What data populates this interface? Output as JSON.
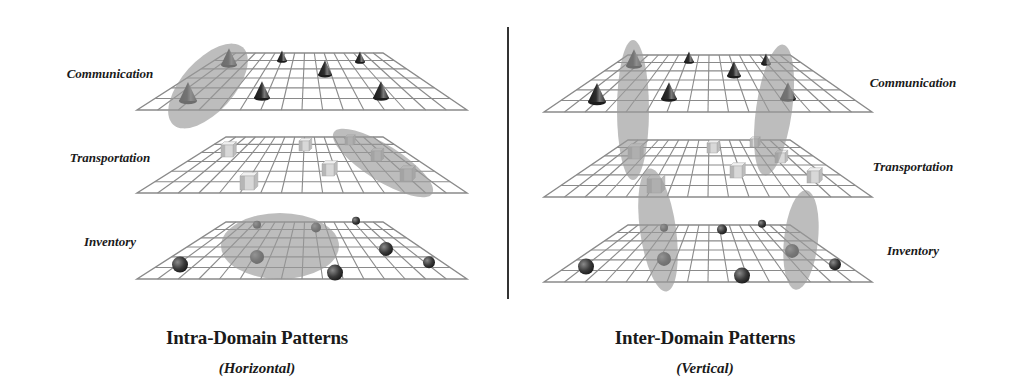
{
  "colors": {
    "grid": "#8a8a8a",
    "grid_fill": "#ffffff",
    "highlight": "#9a9a9a",
    "highlight_opacity": 0.65,
    "cone_dark": "#1e1e1e",
    "cone_light": "#6a6a6a",
    "sphere_dark": "#2a2a2a",
    "sphere_light": "#777777",
    "cube_front": "#d8d8d8",
    "cube_side": "#bcbcbc",
    "cube_top": "#f0f0f0",
    "text": "#1a1a1a",
    "divider": "#333333"
  },
  "grid": {
    "cols": 16,
    "rows": 6
  },
  "left_panel": {
    "title": "Intra-Domain Patterns",
    "subtitle": "(Horizontal)",
    "title_pos": {
      "x": 257,
      "y": 327
    },
    "subtitle_pos": {
      "x": 257,
      "y": 360
    },
    "labels": [
      {
        "text": "Communication",
        "x": 110,
        "y": 74
      },
      {
        "text": "Transportation",
        "x": 110,
        "y": 158
      },
      {
        "text": "Inventory",
        "x": 110,
        "y": 242
      }
    ],
    "planes": [
      {
        "layer": "Communication",
        "top_y": 53,
        "bottom_y": 110,
        "top_x": [
          226,
          383
        ],
        "bottom_x": [
          137,
          467
        ],
        "objects": [
          {
            "type": "cone",
            "x": 229,
            "y": 65,
            "size": 8
          },
          {
            "type": "cone",
            "x": 282,
            "y": 61,
            "size": 5
          },
          {
            "type": "cone",
            "x": 360,
            "y": 62,
            "size": 5
          },
          {
            "type": "cone",
            "x": 325,
            "y": 75,
            "size": 7
          },
          {
            "type": "cone",
            "x": 188,
            "y": 101,
            "size": 9
          },
          {
            "type": "cone",
            "x": 262,
            "y": 98,
            "size": 8
          },
          {
            "type": "cone",
            "x": 381,
            "y": 98,
            "size": 8
          }
        ]
      },
      {
        "layer": "Transportation",
        "top_y": 137,
        "bottom_y": 193,
        "top_x": [
          226,
          383
        ],
        "bottom_x": [
          137,
          467
        ],
        "objects": [
          {
            "type": "cube",
            "x": 227,
            "y": 151,
            "size": 6
          },
          {
            "type": "cube",
            "x": 304,
            "y": 146,
            "size": 5
          },
          {
            "type": "cube",
            "x": 349,
            "y": 141,
            "size": 4
          },
          {
            "type": "cube",
            "x": 376,
            "y": 156,
            "size": 5
          },
          {
            "type": "cube",
            "x": 328,
            "y": 170,
            "size": 6
          },
          {
            "type": "cube",
            "x": 406,
            "y": 175,
            "size": 6
          },
          {
            "type": "cube",
            "x": 247,
            "y": 183,
            "size": 7
          }
        ]
      },
      {
        "layer": "Inventory",
        "top_y": 222,
        "bottom_y": 279,
        "top_x": [
          226,
          383
        ],
        "bottom_x": [
          137,
          467
        ],
        "objects": [
          {
            "type": "sphere",
            "x": 257,
            "y": 226,
            "r": 4
          },
          {
            "type": "sphere",
            "x": 316,
            "y": 229,
            "r": 5
          },
          {
            "type": "sphere",
            "x": 356,
            "y": 222,
            "r": 4
          },
          {
            "type": "sphere",
            "x": 386,
            "y": 251,
            "r": 7
          },
          {
            "type": "sphere",
            "x": 257,
            "y": 259,
            "r": 7
          },
          {
            "type": "sphere",
            "x": 429,
            "y": 264,
            "r": 6
          },
          {
            "type": "sphere",
            "x": 180,
            "y": 267,
            "r": 8
          },
          {
            "type": "sphere",
            "x": 335,
            "y": 275,
            "r": 8
          }
        ]
      }
    ],
    "highlights": [
      {
        "cx": 208,
        "cy": 86,
        "rx": 26,
        "ry": 52,
        "rotate": 42
      },
      {
        "cx": 383,
        "cy": 163,
        "rx": 18,
        "ry": 58,
        "rotate": -58
      },
      {
        "cx": 280,
        "cy": 246,
        "rx": 59,
        "ry": 33,
        "rotate": 0
      }
    ]
  },
  "right_panel": {
    "title": "Inter-Domain Patterns",
    "subtitle": "(Vertical)",
    "title_pos": {
      "x": 705,
      "y": 327
    },
    "subtitle_pos": {
      "x": 705,
      "y": 360
    },
    "labels": [
      {
        "text": "Communication",
        "x": 913,
        "y": 83
      },
      {
        "text": "Transportation",
        "x": 913,
        "y": 167
      },
      {
        "text": "Inventory",
        "x": 913,
        "y": 251
      }
    ],
    "planes": [
      {
        "layer": "Communication",
        "top_y": 55,
        "bottom_y": 112,
        "top_x": [
          628,
          790
        ],
        "bottom_x": [
          544,
          872
        ],
        "objects": [
          {
            "type": "cone",
            "x": 634,
            "y": 66,
            "size": 8
          },
          {
            "type": "cone",
            "x": 689,
            "y": 62,
            "size": 5
          },
          {
            "type": "cone",
            "x": 766,
            "y": 64,
            "size": 5
          },
          {
            "type": "cone",
            "x": 734,
            "y": 76,
            "size": 7
          },
          {
            "type": "cone",
            "x": 597,
            "y": 102,
            "size": 9
          },
          {
            "type": "cone",
            "x": 669,
            "y": 99,
            "size": 8
          },
          {
            "type": "cone",
            "x": 788,
            "y": 99,
            "size": 8
          }
        ]
      },
      {
        "layer": "Transportation",
        "top_y": 140,
        "bottom_y": 197,
        "top_x": [
          628,
          790
        ],
        "bottom_x": [
          544,
          872
        ],
        "objects": [
          {
            "type": "cube",
            "x": 634,
            "y": 153,
            "size": 6
          },
          {
            "type": "cube",
            "x": 712,
            "y": 148,
            "size": 5
          },
          {
            "type": "cube",
            "x": 754,
            "y": 143,
            "size": 4
          },
          {
            "type": "cube",
            "x": 780,
            "y": 158,
            "size": 5
          },
          {
            "type": "cube",
            "x": 736,
            "y": 172,
            "size": 6
          },
          {
            "type": "cube",
            "x": 813,
            "y": 177,
            "size": 6
          },
          {
            "type": "cube",
            "x": 654,
            "y": 186,
            "size": 7
          }
        ]
      },
      {
        "layer": "Inventory",
        "top_y": 225,
        "bottom_y": 282,
        "top_x": [
          628,
          790
        ],
        "bottom_x": [
          544,
          872
        ],
        "objects": [
          {
            "type": "sphere",
            "x": 664,
            "y": 229,
            "r": 4
          },
          {
            "type": "sphere",
            "x": 722,
            "y": 231,
            "r": 5
          },
          {
            "type": "sphere",
            "x": 762,
            "y": 225,
            "r": 4
          },
          {
            "type": "sphere",
            "x": 792,
            "y": 253,
            "r": 7
          },
          {
            "type": "sphere",
            "x": 664,
            "y": 261,
            "r": 7
          },
          {
            "type": "sphere",
            "x": 835,
            "y": 266,
            "r": 6
          },
          {
            "type": "sphere",
            "x": 586,
            "y": 269,
            "r": 8
          },
          {
            "type": "sphere",
            "x": 742,
            "y": 278,
            "r": 8
          }
        ]
      }
    ],
    "highlights": [
      {
        "cx": 633,
        "cy": 110,
        "rx": 16,
        "ry": 70,
        "rotate": 0
      },
      {
        "cx": 658,
        "cy": 230,
        "rx": 18,
        "ry": 62,
        "rotate": -8
      },
      {
        "cx": 774,
        "cy": 110,
        "rx": 18,
        "ry": 66,
        "rotate": 8
      },
      {
        "cx": 801,
        "cy": 240,
        "rx": 17,
        "ry": 50,
        "rotate": 6
      }
    ]
  },
  "icons": {
    "cone": "cone-icon",
    "cube": "cube-icon",
    "sphere": "sphere-icon"
  }
}
